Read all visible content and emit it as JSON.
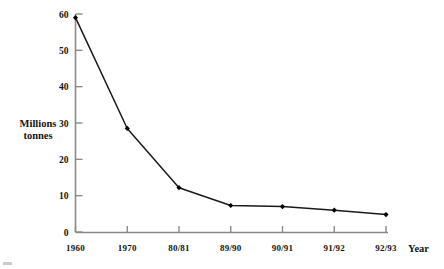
{
  "chart_data": {
    "type": "line",
    "title": "",
    "xlabel": "Year",
    "ylabel": "Millions tonnes",
    "ylabel_lines": [
      "Millions",
      "tonnes"
    ],
    "categories": [
      "1960",
      "1970",
      "80/81",
      "89/90",
      "90/91",
      "91/92",
      "92/93"
    ],
    "values": [
      59,
      28.5,
      12.2,
      7.3,
      7,
      6,
      4.8
    ],
    "series": [
      {
        "name": "Millions tonnes",
        "values": [
          59,
          28.5,
          12.2,
          7.3,
          7,
          6,
          4.8
        ]
      }
    ],
    "ylim": [
      0,
      60
    ],
    "yticks": [
      0,
      10,
      20,
      30,
      40,
      50,
      60
    ],
    "ytick_labels": [
      "0",
      "10",
      "20",
      "30",
      "40",
      "50",
      "60"
    ],
    "xtick_labels": [
      "1960",
      "1970",
      "80/81",
      "89/90",
      "90/91",
      "91/92",
      "92/93"
    ],
    "grid": false,
    "legend": "none",
    "marker": "filled-diamond",
    "line_color": "#1a1a1a",
    "marker_color": "#000000",
    "axis_color": "#8a8a8a"
  }
}
